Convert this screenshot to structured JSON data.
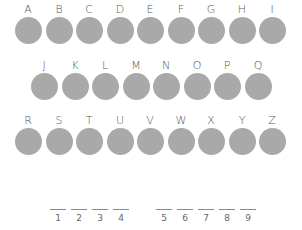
{
  "colors": {
    "circle": "#a9a9a9",
    "text": "#555555",
    "line": "#8a8a8a"
  },
  "rows": [
    {
      "letters": [
        "A",
        "B",
        "C",
        "D",
        "E",
        "F",
        "G",
        "H",
        "I"
      ]
    },
    {
      "letters": [
        "J",
        "K",
        "L",
        "M",
        "N",
        "O",
        "P",
        "Q"
      ]
    },
    {
      "letters": [
        "R",
        "S",
        "T",
        "U",
        "V",
        "W",
        "X",
        "Y",
        "Z"
      ]
    }
  ],
  "answer_slots": {
    "group1": [
      "1",
      "2",
      "3",
      "4"
    ],
    "group2": [
      "5",
      "6",
      "7",
      "8",
      "9"
    ]
  }
}
